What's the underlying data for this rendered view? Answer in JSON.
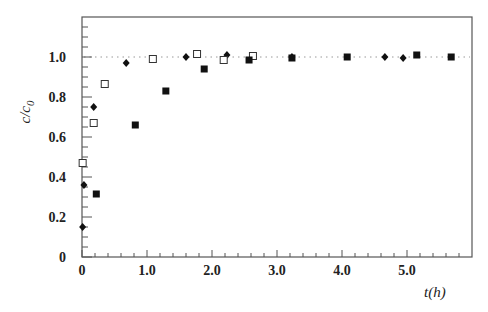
{
  "chart_data": {
    "type": "scatter",
    "title": "",
    "xlabel": "t(h)",
    "ylabel": "c/c0",
    "ylabel_main": "c/c",
    "ylabel_sub": "0",
    "xlim": [
      0,
      6.0
    ],
    "ylim": [
      0,
      1.2
    ],
    "x_ticks": [
      0,
      1.0,
      2.0,
      3.0,
      4.0,
      5.0
    ],
    "x_tick_labels": [
      "0",
      "1.0",
      "2.0",
      "3.0",
      "4.0",
      "5.0"
    ],
    "y_ticks": [
      0,
      0.2,
      0.4,
      0.6,
      0.8,
      1.0
    ],
    "y_tick_labels": [
      "0",
      "0.2",
      "0.4",
      "0.6",
      "0.8",
      "1.0"
    ],
    "x_minor_step": 0.2,
    "y_minor_step": 0.05,
    "grid": false,
    "reference_line": {
      "y": 1.0,
      "style": "dotted"
    },
    "legend": null,
    "series": [
      {
        "name": "filled diamonds",
        "marker": "diamond-filled",
        "points": [
          [
            0.01,
            0.15
          ],
          [
            0.03,
            0.36
          ],
          [
            0.18,
            0.75
          ],
          [
            0.68,
            0.97
          ],
          [
            1.6,
            1.0
          ],
          [
            2.23,
            1.01
          ],
          [
            3.23,
            1.0
          ],
          [
            4.66,
            1.0
          ],
          [
            4.94,
            0.995
          ]
        ]
      },
      {
        "name": "open squares",
        "marker": "square-open",
        "points": [
          [
            0.01,
            0.47
          ],
          [
            0.18,
            0.67
          ],
          [
            0.35,
            0.865
          ],
          [
            1.09,
            0.99
          ],
          [
            1.77,
            1.015
          ],
          [
            2.18,
            0.985
          ],
          [
            2.63,
            1.005
          ]
        ]
      },
      {
        "name": "filled squares",
        "marker": "square-filled",
        "points": [
          [
            0.22,
            0.315
          ],
          [
            0.82,
            0.66
          ],
          [
            1.29,
            0.83
          ],
          [
            1.88,
            0.94
          ],
          [
            2.57,
            0.985
          ],
          [
            3.23,
            0.995
          ],
          [
            4.08,
            1.0
          ],
          [
            5.15,
            1.01
          ],
          [
            5.68,
            1.0
          ]
        ]
      }
    ]
  },
  "colors": {
    "axis": "#555555",
    "marker": "#111111",
    "reference_line": "#999999",
    "background": "#ffffff"
  },
  "layout": {
    "plot_left": 82,
    "plot_right": 472,
    "plot_top": 17,
    "plot_bottom": 257,
    "px_per_x": 65,
    "px_per_y": 200
  }
}
